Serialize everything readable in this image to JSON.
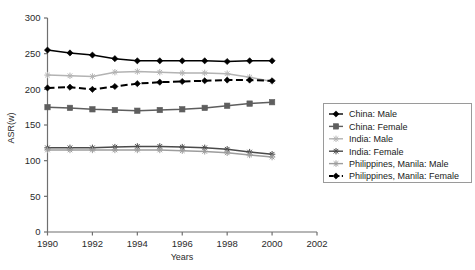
{
  "chart_data": {
    "type": "line",
    "title": "",
    "xlabel": "Years",
    "ylabel": "ASR(w)",
    "xlim": [
      1990,
      2002
    ],
    "ylim": [
      0,
      300
    ],
    "xticks": [
      1990,
      1992,
      1994,
      1996,
      1998,
      2000,
      2002
    ],
    "yticks": [
      0,
      50,
      100,
      150,
      200,
      250,
      300
    ],
    "grid": false,
    "legend_position": "right",
    "x": [
      1990,
      1991,
      1992,
      1993,
      1994,
      1995,
      1996,
      1997,
      1998,
      1999,
      2000
    ],
    "series": [
      {
        "name": "China: Male",
        "color": "#000000",
        "marker": "diamond",
        "dash": "solid",
        "values": [
          255,
          251,
          248,
          243,
          240,
          240,
          240,
          240,
          239,
          240,
          240
        ]
      },
      {
        "name": "China: Female",
        "color": "#5e5e5e",
        "marker": "square",
        "dash": "solid",
        "values": [
          175,
          174,
          172,
          171,
          170,
          171,
          172,
          174,
          177,
          180,
          182
        ]
      },
      {
        "name": "India: Male",
        "color": "#b3b3b3",
        "marker": "cross",
        "dash": "solid",
        "values": [
          220,
          219,
          218,
          224,
          225,
          224,
          223,
          223,
          222,
          217,
          211
        ]
      },
      {
        "name": "India: Female",
        "color": "#4a4a4a",
        "marker": "cross",
        "dash": "solid",
        "values": [
          118,
          118,
          118,
          119,
          120,
          120,
          119,
          118,
          116,
          112,
          109
        ]
      },
      {
        "name": "Philippines, Manila: Male",
        "color": "#9d9d9d",
        "marker": "cross",
        "dash": "solid",
        "values": [
          115,
          115,
          115,
          115,
          115,
          115,
          114,
          113,
          111,
          108,
          105
        ]
      },
      {
        "name": "Philippines, Manila: Female",
        "color": "#000000",
        "marker": "diamond",
        "dash": "dashed",
        "values": [
          202,
          203,
          200,
          204,
          208,
          210,
          211,
          212,
          213,
          213,
          212
        ]
      }
    ]
  },
  "legend": {
    "items": [
      "China: Male",
      "China: Female",
      "India: Male",
      "India: Female",
      "Philippines, Manila: Male",
      "Philippines, Manila: Female"
    ]
  },
  "axes": {
    "x_tick_labels": [
      "1990",
      "1992",
      "1994",
      "1996",
      "1998",
      "2000",
      "2002"
    ],
    "y_tick_labels": [
      "0",
      "50",
      "100",
      "150",
      "200",
      "250",
      "300"
    ],
    "x_title": "Years",
    "y_title": "ASR(w)"
  }
}
